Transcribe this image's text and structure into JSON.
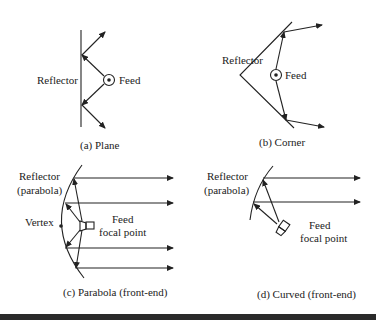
{
  "panels": {
    "a": {
      "caption": "(a) Plane",
      "labels": {
        "reflector": "Reflector",
        "feed": "Feed"
      }
    },
    "b": {
      "caption": "(b) Corner",
      "labels": {
        "reflector": "Reflector",
        "feed": "Feed"
      }
    },
    "c": {
      "caption": "(c) Parabola (front-end)",
      "labels": {
        "reflector_line1": "Reflector",
        "reflector_line2": "(parabola)",
        "vertex": "Vertex",
        "feed_line1": "Feed",
        "feed_line2": "focal point"
      }
    },
    "d": {
      "caption": "(d) Curved (front-end)",
      "labels": {
        "reflector_line1": "Reflector",
        "reflector_line2": "(parabola)",
        "feed_line1": "Feed",
        "feed_line2": "focal point"
      }
    }
  },
  "colors": {
    "ink": "#222222",
    "background": "#ffffff",
    "rule": "#2a2a2a"
  }
}
